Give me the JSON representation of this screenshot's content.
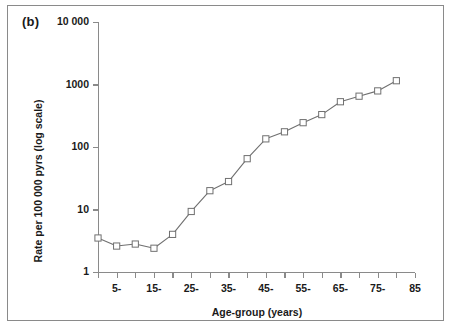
{
  "figure": {
    "panel_label": "(b)"
  },
  "chart_data": {
    "type": "line",
    "title": "",
    "xlabel": "Age-group (years)",
    "ylabel": "Rate per 100 000 pyrs (log scale)",
    "yscale": "log",
    "ylim": [
      1,
      10000
    ],
    "xlim": [
      0,
      85
    ],
    "grid": false,
    "legend": null,
    "marker": "open-square",
    "line_color": "#707070",
    "marker_edge_color": "#707070",
    "marker_face_color": "#ffffff",
    "ytick_labels": [
      "1",
      "10",
      "100",
      "1000",
      "10 000"
    ],
    "ytick_values": [
      1,
      10,
      100,
      1000,
      10000
    ],
    "xtick_values": [
      0,
      5,
      10,
      15,
      20,
      25,
      30,
      35,
      40,
      45,
      50,
      55,
      60,
      65,
      70,
      75,
      80,
      85
    ],
    "xtick_labels": [
      "",
      "5-",
      "",
      "15-",
      "",
      "25-",
      "",
      "35-",
      "",
      "45-",
      "",
      "55-",
      "",
      "65-",
      "",
      "75-",
      "",
      "85"
    ],
    "categories": [
      "0-",
      "5-",
      "10-",
      "15-",
      "20-",
      "25-",
      "30-",
      "35-",
      "40-",
      "45-",
      "50-",
      "55-",
      "60-",
      "65-",
      "70-",
      "75-",
      "80-"
    ],
    "x": [
      0,
      5,
      10,
      15,
      20,
      25,
      30,
      35,
      40,
      45,
      50,
      55,
      60,
      65,
      70,
      75,
      80
    ],
    "values": [
      3.5,
      2.6,
      2.8,
      2.4,
      4.0,
      9.3,
      20,
      28,
      65,
      135,
      175,
      245,
      330,
      530,
      650,
      790,
      1150
    ]
  }
}
